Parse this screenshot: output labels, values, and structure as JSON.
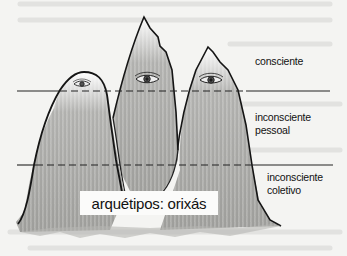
{
  "diagram": {
    "type": "illustration",
    "levels": [
      {
        "id": "conscious",
        "label": "consciente"
      },
      {
        "id": "personal_unconscious",
        "label_line1": "inconsciente",
        "label_line2": "pessoal"
      },
      {
        "id": "collective_unconscious",
        "label_line1": "inconsciente",
        "label_line2": "coletivo"
      }
    ],
    "base_label": "arquétipos: orixás",
    "peaks": [
      {
        "name": "left",
        "has_eye": true
      },
      {
        "name": "middle",
        "has_eye": true
      },
      {
        "name": "right",
        "has_eye": true
      }
    ],
    "colors": {
      "background": "#f4f4f2",
      "ink": "#111111",
      "shading": "#9a9a98",
      "line": "#222222"
    }
  }
}
